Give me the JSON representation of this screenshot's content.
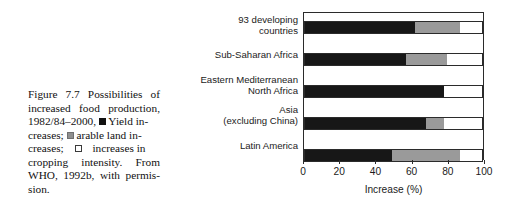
{
  "caption": {
    "lines": [
      "Figure 7.7 Possibilities of",
      "increased food production,",
      "1982/84–2000,",
      "Yield in-",
      "creases;",
      "arable land in-",
      "creases;",
      "increases  in",
      "cropping intensity. From",
      "WHO, 1992b, with permis-",
      "sion."
    ],
    "legend": [
      {
        "key": "yield-increases",
        "swatch": "black-square",
        "text": "Yield increases"
      },
      {
        "key": "arable-land-increases",
        "swatch": "gray-square",
        "text": "arable land increases"
      },
      {
        "key": "cropping-intensity",
        "swatch": "white-square",
        "text": "increases in cropping intensity"
      }
    ],
    "source": "From WHO, 1992b, with permission."
  },
  "chart_data": {
    "type": "bar",
    "orientation": "horizontal",
    "stacked": true,
    "title": "",
    "xlabel": "Increase (%)",
    "ylabel": "",
    "xlim": [
      0,
      100
    ],
    "xticks": [
      0,
      20,
      40,
      60,
      80,
      100
    ],
    "xtick_labels": [
      "0",
      "20",
      "40",
      "60",
      "80",
      "100"
    ],
    "grid": false,
    "legend_position": "caption",
    "categories": [
      "93 developing countries",
      "Sub-Saharan Africa",
      "Eastern Mediterranean North Africa",
      "Asia (excluding China)",
      "Latin America"
    ],
    "category_label_lines": [
      [
        "93 developing",
        "countries"
      ],
      [
        "Sub-Saharan Africa"
      ],
      [
        "Eastern Mediterranean",
        "North Africa"
      ],
      [
        "Asia",
        "(excluding China)"
      ],
      [
        "Latin America"
      ]
    ],
    "series": [
      {
        "name": "Yield increases",
        "color": "#171717",
        "values": [
          62,
          57,
          78,
          68,
          49
        ]
      },
      {
        "name": "Arable land increases",
        "color": "#9a9a9a",
        "values": [
          25,
          23,
          0,
          10,
          38
        ]
      },
      {
        "name": "Increases in cropping intensity",
        "color": "#ffffff",
        "values": [
          13,
          20,
          22,
          22,
          13
        ]
      }
    ]
  },
  "colors": {
    "yield": "#171717",
    "arable": "#9a9a9a",
    "cropping": "#ffffff",
    "frame": "#2b2b2b",
    "text": "#1b1b1b"
  }
}
